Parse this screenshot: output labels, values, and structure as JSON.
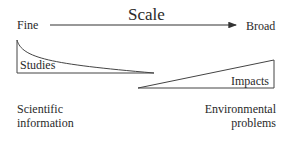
{
  "diagram": {
    "title": "Scale",
    "axis": {
      "left_label": "Fine",
      "right_label": "Broad",
      "direction": "left-to-right arrow"
    },
    "shapes": [
      {
        "name": "Studies",
        "label": "Studies",
        "form": "decaying curve (high at fine scale, tapering toward broad)"
      },
      {
        "name": "Impacts",
        "label": "Impacts",
        "form": "increasing wedge (small at fine scale, growing toward broad)"
      }
    ],
    "bottom_labels": {
      "left": {
        "line1": "Scientific",
        "line2": "information"
      },
      "right": {
        "line1": "Environmental",
        "line2": "problems"
      }
    },
    "colors": {
      "line": "#333333",
      "text": "#2a2a2a",
      "background": "#ffffff"
    }
  }
}
